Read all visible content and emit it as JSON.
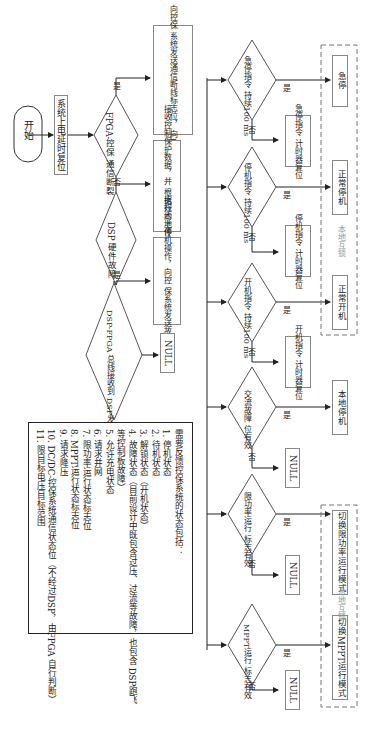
{
  "diagram": {
    "type": "flowchart",
    "orientation": "rotated-90-ccw",
    "start": "开始",
    "init_step": "系统上电延时复位",
    "decisions": {
      "fpga_comm_break": {
        "label_line1": "FPGA-控保",
        "label_line2": "通信断裂",
        "yes": "是",
        "no": "否",
        "yes_action": [
          "执行本地停机操作，向控保",
          "系统发送通信断线标志位，",
          "向DSP发送通信断线标志位"
        ]
      },
      "dsp_hw_fault": {
        "label_line1": "DSP",
        "label_line2": "硬件故障",
        "yes": "是",
        "no": "否",
        "no_action": [
          "接收控制保护数据，并",
          "根据规约上传本地状态"
        ]
      },
      "bus_fault_flag": {
        "label_line1": "DSP-FPGA 总线接收到",
        "label_line2": "DSP发送的故障标志位",
        "yes": "是",
        "yes_action": [
          "执行本地停机操作，向控",
          "保系统发送故障标志位"
        ],
        "no_action": "NULL"
      }
    },
    "branches": [
      {
        "cond_line1": "急停指令",
        "cond_line2": "持续100 ms",
        "yes": "是",
        "no": "否",
        "yes_action": "急停",
        "no_action": [
          "急停指令",
          "计时器复位"
        ]
      },
      {
        "cond_line1": "停机指令",
        "cond_line2": "持续100 ms",
        "yes": "是",
        "no": "否",
        "yes_action": "正常停机",
        "no_action": [
          "停机指令",
          "计时器复位"
        ]
      },
      {
        "cond_line1": "开机指令",
        "cond_line2": "持续100 ms",
        "yes": "是",
        "no": "否",
        "yes_action": "正常开机",
        "no_action": [
          "开机指令",
          "计时器复位"
        ]
      },
      {
        "cond_line1": "交流故障",
        "cond_line2": "位有效",
        "yes": "是",
        "no": "否",
        "yes_action": "本地停机",
        "no_action": "NULL"
      },
      {
        "cond_line1": "限功率运行",
        "cond_line2": "标志有效",
        "yes": "是",
        "no": "否",
        "yes_action": "切换限功率运行模式",
        "no_action": "NULL"
      },
      {
        "cond_line1": "MPPT运行",
        "cond_line2": "标志有效",
        "yes": "是",
        "no": "否",
        "yes_action": "切换MPPT运行模式",
        "no_action": "NULL"
      }
    ],
    "interlock_groups": [
      {
        "label": "本地互锁",
        "members": [
          "急停",
          "正常停机",
          "正常开机"
        ]
      },
      {
        "label": "本地互锁",
        "members": [
          "切换限功率运行模式",
          "切换MPPT运行模式"
        ]
      }
    ],
    "legend": {
      "title": "需要反馈控保系统的状态包括：",
      "items": [
        "1. 停机状态",
        "2. 待机状态",
        "3. 解锁状态（开机状态）",
        "4. 故障状态（目前设计中既包含过压、过流等故障，也包含 DSP跑飞",
        "    等控制板故障）",
        "5. 允许充电状态",
        "6. 请求并网",
        "7. 限功率运行状态标志位",
        "8. MPPT运行状态标志位",
        "9. 请求降压",
        "10. DC/DC-控保系统通信状态位（不经过DSP，由FPGA 自行判断）",
        "11. 限目标电压目标范围"
      ]
    }
  }
}
